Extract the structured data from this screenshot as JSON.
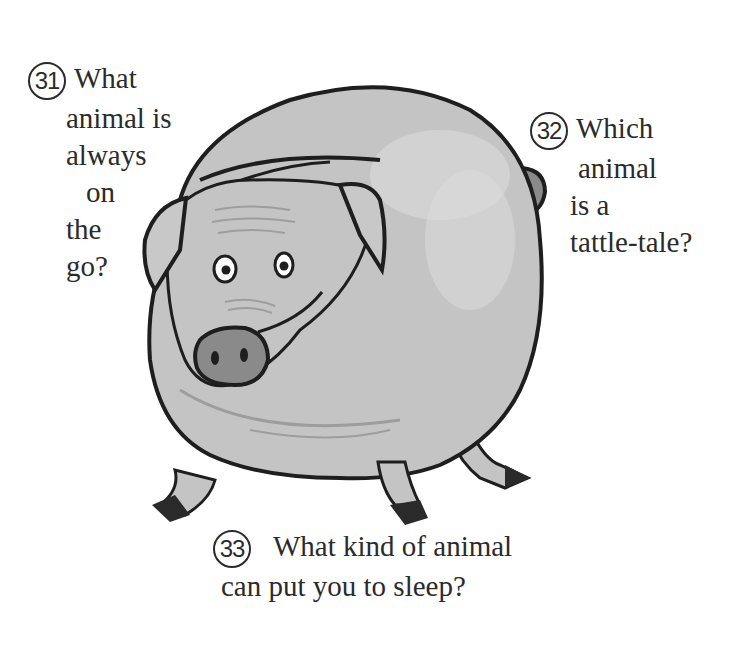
{
  "questions": [
    {
      "number": "31",
      "lines": [
        "What",
        "animal is",
        "always",
        "on",
        "the",
        "go?"
      ]
    },
    {
      "number": "32",
      "lines": [
        "Which",
        "animal",
        "is a",
        "tattle-tale?"
      ]
    },
    {
      "number": "33",
      "lines": [
        "What kind of animal",
        "can put you to sleep?"
      ]
    }
  ],
  "illustration": {
    "subject": "pig-cartoon",
    "colors": {
      "body": "#c4c4c4",
      "highlight": "#dcdcdc",
      "outline": "#1e1e1e",
      "snout": "#8a8a8a",
      "wrinkle": "#9d9d9d"
    }
  }
}
